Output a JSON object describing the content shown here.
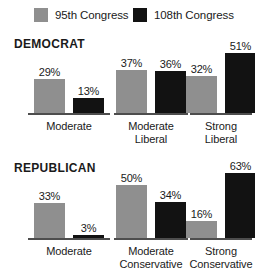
{
  "legend": {
    "items": [
      {
        "label": "95th Congress",
        "color": "#8f8f8f",
        "series_key": "95th"
      },
      {
        "label": "108th Congress",
        "color": "#121212",
        "series_key": "108th"
      }
    ]
  },
  "panels": [
    {
      "title": "DEMOCRAT",
      "groups": [
        {
          "label_line1": "Moderate",
          "label_line2": "",
          "bars": [
            {
              "series": "95th Congress",
              "value": 29,
              "value_label": "29%"
            },
            {
              "series": "108th Congress",
              "value": 13,
              "value_label": "13%"
            }
          ]
        },
        {
          "label_line1": "Moderate",
          "label_line2": "Liberal",
          "bars": [
            {
              "series": "95th Congress",
              "value": 37,
              "value_label": "37%"
            },
            {
              "series": "108th Congress",
              "value": 36,
              "value_label": "36%"
            }
          ]
        },
        {
          "label_line1": "Strong",
          "label_line2": "Liberal",
          "bars": [
            {
              "series": "95th Congress",
              "value": 32,
              "value_label": "32%"
            },
            {
              "series": "108th Congress",
              "value": 51,
              "value_label": "51%"
            }
          ]
        }
      ]
    },
    {
      "title": "REPUBLICAN",
      "groups": [
        {
          "label_line1": "Moderate",
          "label_line2": "",
          "bars": [
            {
              "series": "95th Congress",
              "value": 33,
              "value_label": "33%"
            },
            {
              "series": "108th Congress",
              "value": 3,
              "value_label": "3%"
            }
          ]
        },
        {
          "label_line1": "Moderate",
          "label_line2": "Conservative",
          "bars": [
            {
              "series": "95th Congress",
              "value": 50,
              "value_label": "50%"
            },
            {
              "series": "108th Congress",
              "value": 34,
              "value_label": "34%"
            }
          ]
        },
        {
          "label_line1": "Strong",
          "label_line2": "Conservative",
          "bars": [
            {
              "series": "95th Congress",
              "value": 16,
              "value_label": "16%"
            },
            {
              "series": "108th Congress",
              "value": 63,
              "value_label": "63%"
            }
          ]
        }
      ]
    }
  ],
  "chart_data": {
    "type": "bar",
    "title": "",
    "xlabel": "",
    "ylabel": "",
    "ylim": [
      0,
      70
    ],
    "grid": false,
    "legend_position": "top",
    "panels": [
      {
        "name": "DEMOCRAT",
        "categories": [
          "Moderate",
          "Moderate Liberal",
          "Strong Liberal"
        ],
        "series": [
          {
            "name": "95th Congress",
            "color": "#8f8f8f",
            "values": [
              29,
              37,
              32
            ]
          },
          {
            "name": "108th Congress",
            "color": "#121212",
            "values": [
              13,
              36,
              51
            ]
          }
        ]
      },
      {
        "name": "REPUBLICAN",
        "categories": [
          "Moderate",
          "Moderate Conservative",
          "Strong Conservative"
        ],
        "series": [
          {
            "name": "95th Congress",
            "color": "#8f8f8f",
            "values": [
              33,
              50,
              16
            ]
          },
          {
            "name": "108th Congress",
            "color": "#121212",
            "values": [
              3,
              34,
              63
            ]
          }
        ]
      }
    ],
    "value_unit": "percent",
    "data_labels": true
  },
  "scale": {
    "px_per_percent_democrat": 1.17,
    "px_per_percent_republican": 1.05
  }
}
